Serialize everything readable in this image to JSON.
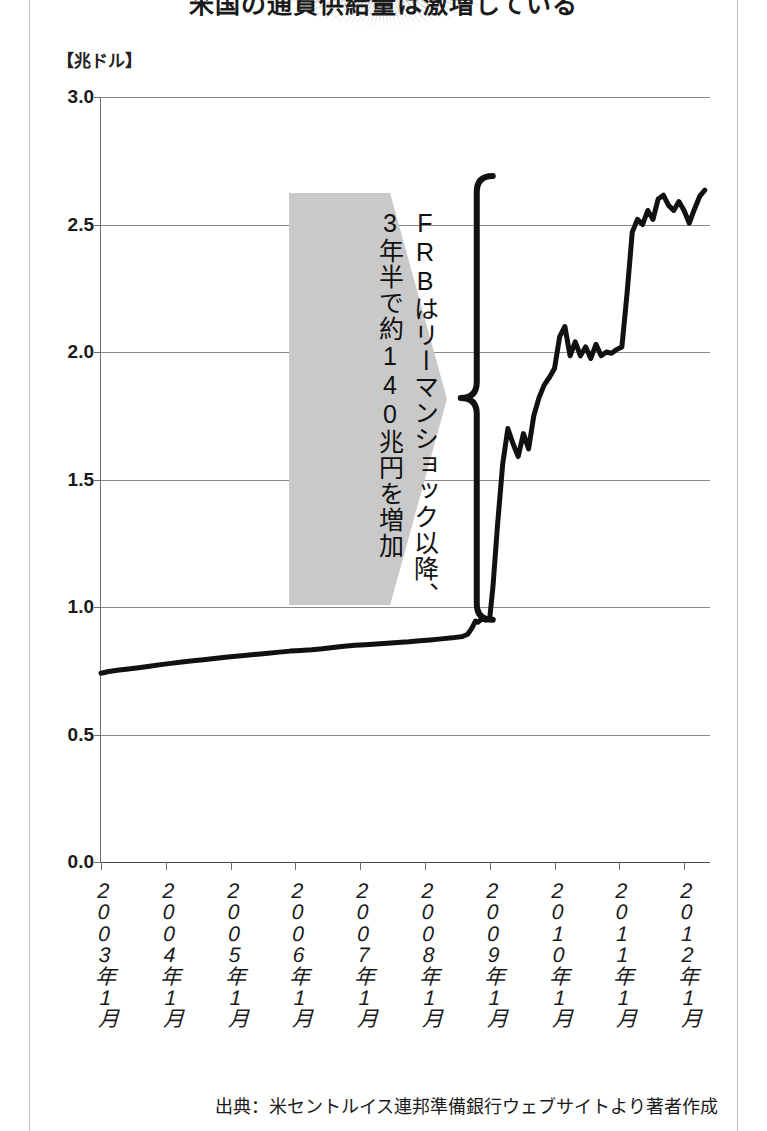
{
  "title": {
    "text": "米国の通貨供給量は激増している",
    "starburst_icon": "starburst-icon"
  },
  "unit_label": "【兆ドル】",
  "source_note": "出典：米セントルイス連邦準備銀行ウェブサイトより著者作成",
  "callout": {
    "line1": "FRBはリーマンショック以降、",
    "line2": "3年半で約140兆円を増加",
    "fill_color": "#c9c9c9",
    "brace_color": "#111111"
  },
  "chart_data": {
    "type": "line",
    "title": "米国の通貨供給量は激増している",
    "xlabel": "",
    "ylabel": "【兆ドル】",
    "ylim": [
      0.0,
      3.0
    ],
    "ytick_labels": [
      "0.0",
      "0.5",
      "1.0",
      "1.5",
      "2.0",
      "2.5",
      "3.0"
    ],
    "ytick_values": [
      0.0,
      0.5,
      1.0,
      1.5,
      2.0,
      2.5,
      3.0
    ],
    "grid": true,
    "legend": "none",
    "line_color": "#111111",
    "line_width": 5,
    "xtick_labels": [
      "2003年1月",
      "2004年1月",
      "2005年1月",
      "2006年1月",
      "2007年1月",
      "2008年1月",
      "2009年1月",
      "2010年1月",
      "2011年1月",
      "2012年1月"
    ],
    "xtick_x": [
      2003.0,
      2004.0,
      2005.0,
      2006.0,
      2007.0,
      2008.0,
      2009.0,
      2010.0,
      2011.0,
      2012.0
    ],
    "xlim": [
      2003.0,
      2012.4
    ],
    "series": [
      {
        "name": "米FRB 総資産（マネタリーベース）",
        "x": [
          2003.0,
          2003.12,
          2003.25,
          2003.42,
          2003.58,
          2003.75,
          2003.92,
          2004.08,
          2004.25,
          2004.42,
          2004.58,
          2004.75,
          2004.92,
          2005.08,
          2005.25,
          2005.42,
          2005.58,
          2005.75,
          2005.92,
          2006.08,
          2006.25,
          2006.42,
          2006.58,
          2006.75,
          2006.92,
          2007.08,
          2007.25,
          2007.42,
          2007.58,
          2007.75,
          2007.92,
          2008.08,
          2008.25,
          2008.42,
          2008.58,
          2008.66,
          2008.72,
          2008.78,
          2008.82,
          2008.86,
          2008.9,
          2008.94,
          2009.0,
          2009.05,
          2009.12,
          2009.2,
          2009.28,
          2009.36,
          2009.44,
          2009.52,
          2009.6,
          2009.68,
          2009.76,
          2009.84,
          2009.92,
          2010.0,
          2010.08,
          2010.16,
          2010.24,
          2010.32,
          2010.4,
          2010.48,
          2010.56,
          2010.64,
          2010.72,
          2010.8,
          2010.88,
          2010.96,
          2011.04,
          2011.12,
          2011.2,
          2011.28,
          2011.36,
          2011.44,
          2011.52,
          2011.6,
          2011.68,
          2011.76,
          2011.84,
          2011.92,
          2012.0,
          2012.08,
          2012.16,
          2012.24,
          2012.32
        ],
        "y": [
          0.74,
          0.747,
          0.752,
          0.757,
          0.762,
          0.768,
          0.774,
          0.779,
          0.784,
          0.789,
          0.793,
          0.798,
          0.803,
          0.807,
          0.811,
          0.815,
          0.819,
          0.823,
          0.827,
          0.829,
          0.832,
          0.836,
          0.841,
          0.846,
          0.85,
          0.852,
          0.855,
          0.858,
          0.861,
          0.864,
          0.868,
          0.871,
          0.875,
          0.879,
          0.884,
          0.893,
          0.915,
          0.945,
          0.94,
          0.95,
          0.952,
          0.948,
          0.955,
          1.08,
          1.32,
          1.56,
          1.7,
          1.64,
          1.59,
          1.68,
          1.62,
          1.75,
          1.82,
          1.87,
          1.9,
          1.935,
          2.06,
          2.1,
          1.985,
          2.04,
          1.985,
          2.02,
          1.975,
          2.03,
          1.985,
          2.0,
          1.995,
          2.01,
          2.02,
          2.23,
          2.47,
          2.52,
          2.5,
          2.555,
          2.52,
          2.6,
          2.615,
          2.575,
          2.555,
          2.59,
          2.555,
          2.505,
          2.56,
          2.61,
          2.635
        ]
      }
    ],
    "annotations": [
      {
        "type": "brace",
        "orientation": "left",
        "y_top": 2.69,
        "y_bottom": 0.95,
        "x": 2008.8,
        "label": "FRBはリーマンショック以降、3年半で約140兆円を増加"
      }
    ]
  }
}
